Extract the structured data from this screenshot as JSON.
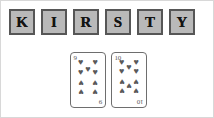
{
  "scene": {
    "width": 214,
    "height": 118,
    "background_color": "#ffffff",
    "border_color": "#d8d8d8"
  },
  "letter_tiles": {
    "word": "KIRSTY",
    "tile_fill_color": "#b9b9b9",
    "tile_border_color": "#565656",
    "tile_text_color": "#141414",
    "tiles": [
      {
        "letter": "K"
      },
      {
        "letter": "I"
      },
      {
        "letter": "R"
      },
      {
        "letter": "S"
      },
      {
        "letter": "T"
      },
      {
        "letter": "Y"
      }
    ]
  },
  "cards": {
    "suit_symbol": "♥",
    "suit_name": "hearts",
    "pip_color": "#5a5a5a",
    "rank_color": "#5d5d5d",
    "card_border_color": "#6e6e6e",
    "card_background_color": "#ffffff",
    "items": [
      {
        "rank": "9",
        "suit": "♥",
        "suit_name": "hearts",
        "name": "nine-of-hearts",
        "pip_count": 9,
        "pip_layout": [
          {
            "x": 24,
            "y": 6
          },
          {
            "x": 24,
            "y": 30
          },
          {
            "x": 24,
            "y": 54
          },
          {
            "x": 24,
            "y": 78
          },
          {
            "x": 76,
            "y": 6
          },
          {
            "x": 76,
            "y": 30
          },
          {
            "x": 76,
            "y": 54
          },
          {
            "x": 76,
            "y": 78
          },
          {
            "x": 50,
            "y": 22
          }
        ]
      },
      {
        "rank": "10",
        "suit": "♥",
        "suit_name": "hearts",
        "name": "ten-of-hearts",
        "pip_count": 10,
        "pip_layout": [
          {
            "x": 24,
            "y": 4
          },
          {
            "x": 24,
            "y": 28
          },
          {
            "x": 24,
            "y": 52
          },
          {
            "x": 24,
            "y": 76
          },
          {
            "x": 76,
            "y": 4
          },
          {
            "x": 76,
            "y": 28
          },
          {
            "x": 76,
            "y": 52
          },
          {
            "x": 76,
            "y": 76
          },
          {
            "x": 50,
            "y": 18
          },
          {
            "x": 50,
            "y": 62
          }
        ]
      }
    ]
  }
}
